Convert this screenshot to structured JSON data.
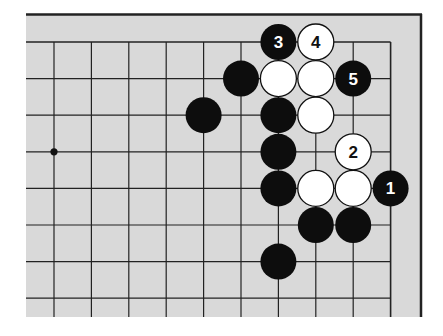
{
  "diagram": {
    "type": "go-board-problem",
    "board": {
      "visible_columns": 10,
      "visible_rows": 8,
      "edges": [
        "top",
        "right"
      ],
      "background_color": "#d9d9d9",
      "line_color": "#222222",
      "star_points": [
        {
          "col": 0,
          "row": 3
        }
      ]
    },
    "stones": [
      {
        "col": 6,
        "row": 0,
        "color": "black",
        "label": "3"
      },
      {
        "col": 7,
        "row": 0,
        "color": "white",
        "label": "4"
      },
      {
        "col": 5,
        "row": 1,
        "color": "black",
        "label": ""
      },
      {
        "col": 6,
        "row": 1,
        "color": "white",
        "label": ""
      },
      {
        "col": 7,
        "row": 1,
        "color": "white",
        "label": ""
      },
      {
        "col": 8,
        "row": 1,
        "color": "black",
        "label": "5"
      },
      {
        "col": 4,
        "row": 2,
        "color": "black",
        "label": ""
      },
      {
        "col": 6,
        "row": 2,
        "color": "black",
        "label": ""
      },
      {
        "col": 7,
        "row": 2,
        "color": "white",
        "label": ""
      },
      {
        "col": 6,
        "row": 3,
        "color": "black",
        "label": ""
      },
      {
        "col": 8,
        "row": 3,
        "color": "white",
        "label": "2"
      },
      {
        "col": 6,
        "row": 4,
        "color": "black",
        "label": ""
      },
      {
        "col": 7,
        "row": 4,
        "color": "white",
        "label": ""
      },
      {
        "col": 8,
        "row": 4,
        "color": "white",
        "label": ""
      },
      {
        "col": 9,
        "row": 4,
        "color": "black",
        "label": "1"
      },
      {
        "col": 7,
        "row": 5,
        "color": "black",
        "label": ""
      },
      {
        "col": 8,
        "row": 5,
        "color": "black",
        "label": ""
      },
      {
        "col": 6,
        "row": 6,
        "color": "black",
        "label": ""
      }
    ]
  }
}
